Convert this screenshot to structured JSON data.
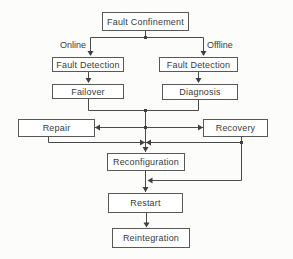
{
  "diagram": {
    "nodes": {
      "fault_confinement": "Fault Confinement",
      "fault_detection_online": "Fault Detection",
      "fault_detection_offline": "Fault Detection",
      "failover": "Failover",
      "diagnosis": "Diagnosis",
      "repair": "Repair",
      "recovery": "Recovery",
      "reconfiguration": "Reconfiguration",
      "restart": "Restart",
      "reintegration": "Reintegration"
    },
    "branch_labels": {
      "online": "Online",
      "offline": "Offline"
    },
    "edges": [
      {
        "from": "fault_confinement",
        "to": "fault_detection_online",
        "label": "Online"
      },
      {
        "from": "fault_confinement",
        "to": "fault_detection_offline",
        "label": "Offline"
      },
      {
        "from": "fault_detection_online",
        "to": "failover"
      },
      {
        "from": "fault_detection_offline",
        "to": "diagnosis"
      },
      {
        "from": "failover",
        "to": "repair"
      },
      {
        "from": "failover",
        "to": "recovery"
      },
      {
        "from": "diagnosis",
        "to": "repair"
      },
      {
        "from": "diagnosis",
        "to": "recovery"
      },
      {
        "from": "repair",
        "to": "reconfiguration"
      },
      {
        "from": "recovery",
        "to": "reconfiguration"
      },
      {
        "from": "recovery",
        "to": "restart"
      },
      {
        "from": "reconfiguration",
        "to": "restart"
      },
      {
        "from": "restart",
        "to": "reintegration"
      }
    ],
    "colors": {
      "background": "#fcfcfb",
      "box_fill": "#ffffff",
      "box_border": "#585858",
      "line": "#4a4a4a",
      "text": "#3a3a3a"
    }
  }
}
